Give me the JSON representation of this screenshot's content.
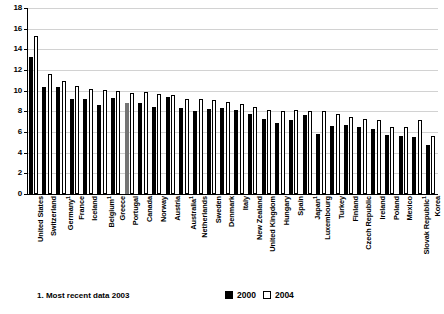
{
  "chart_data": {
    "type": "bar",
    "title": "",
    "subtitle": "",
    "xlabel": "",
    "ylabel": "",
    "ylim": [
      0,
      18
    ],
    "ytick_step": 2,
    "yticks": [
      "0",
      "2",
      "4",
      "6",
      "8",
      "10",
      "12",
      "14",
      "16",
      "18"
    ],
    "grid": true,
    "legend_position": "bottom-right",
    "categories": [
      "United States",
      "Switzerland",
      "Germany",
      "France",
      "Iceland",
      "Belgium",
      "Greece",
      "Portugal",
      "Canada",
      "Norway",
      "Austria",
      "Australia",
      "Netherlands",
      "Sweden",
      "Denmark",
      "Italy",
      "New Zealand",
      "United Kingdom",
      "Hungary",
      "Spain",
      "Japan",
      "Luxembourg",
      "Turkey",
      "Finland",
      "Czech Republic",
      "Ireland",
      "Poland",
      "Mexico",
      "Slovak Republic",
      "Korea"
    ],
    "category_footnote_marks": [
      "",
      "",
      "1",
      "",
      "",
      "1",
      "",
      "",
      "",
      "",
      "",
      "1",
      "",
      "",
      "",
      "",
      "",
      "",
      "",
      "",
      "1",
      "",
      "",
      "",
      "",
      "",
      "",
      "",
      "1",
      ""
    ],
    "series": [
      {
        "name": "2000",
        "color": "#000000",
        "values": [
          13.3,
          10.4,
          10.4,
          9.2,
          9.2,
          8.6,
          9.3,
          8.8,
          8.8,
          8.4,
          9.4,
          8.3,
          8.0,
          8.2,
          8.3,
          8.1,
          7.7,
          7.3,
          6.9,
          7.2,
          7.6,
          5.8,
          6.6,
          6.7,
          6.5,
          6.3,
          5.7,
          5.6,
          5.5,
          4.7
        ]
      },
      {
        "name": "2004",
        "color": "#ffffff",
        "values": [
          15.3,
          11.6,
          10.9,
          10.5,
          10.2,
          10.1,
          10.0,
          9.8,
          9.9,
          9.7,
          9.6,
          9.2,
          9.2,
          9.1,
          8.9,
          8.7,
          8.4,
          8.1,
          8.0,
          8.1,
          8.0,
          8.0,
          7.7,
          7.5,
          7.3,
          7.2,
          6.5,
          6.5,
          7.2,
          5.6
        ]
      }
    ],
    "highlight": {
      "category": "Portugal",
      "series": "2000",
      "color": "#757575"
    }
  },
  "footnote": {
    "text": "1. Most recent data 2003"
  },
  "legend": {
    "entries": [
      {
        "label": "2000",
        "swatch": "filled"
      },
      {
        "label": "2004",
        "swatch": "hollow"
      }
    ]
  }
}
